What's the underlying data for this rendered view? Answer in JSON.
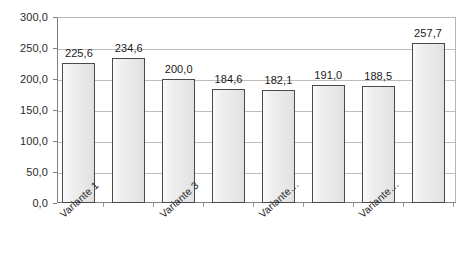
{
  "chart_data": {
    "type": "bar",
    "title": "",
    "subtitle": "",
    "xlabel": "",
    "ylabel": "",
    "categories": [
      "Variante 1",
      "Variante 2",
      "Variante 3",
      "Variante 4",
      "Variante…",
      "Variante 6",
      "Variante…",
      "Variante 8"
    ],
    "visible_tick_labels": [
      "Variante 1",
      "",
      "Variante 3",
      "",
      "Variante…",
      "",
      "Variante…",
      ""
    ],
    "values": [
      225.6,
      234.6,
      200.0,
      184.6,
      182.1,
      191.0,
      188.5,
      257.7
    ],
    "value_labels": [
      "225,6",
      "234,6",
      "200,0",
      "184,6",
      "182,1",
      "191,0",
      "188,5",
      "257,7"
    ],
    "ylim": [
      0,
      300
    ],
    "ytick_values": [
      0,
      50,
      100,
      150,
      200,
      250,
      300
    ],
    "ytick_labels": [
      "0,0",
      "50,0",
      "100,0",
      "150,0",
      "200,0",
      "250,0",
      "300,0"
    ],
    "grid": true,
    "legend": "none",
    "decimal_separator": ",",
    "colors": {
      "bar_fill": "#ececec",
      "bar_border": "#4a4a4a",
      "gridline": "#bdbdbd",
      "axis": "#808080",
      "text": "#1a1a1a",
      "background": "#ffffff"
    }
  }
}
